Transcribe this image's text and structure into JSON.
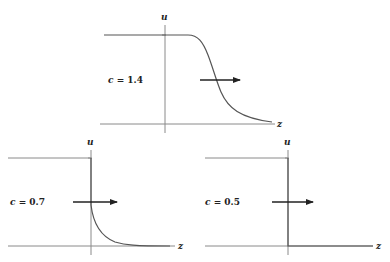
{
  "diagram": {
    "type": "traveling-wave-profiles",
    "panels": [
      {
        "id": "top",
        "c_label": "c = 1.4",
        "c_var": "c",
        "c_value": "= 1.4",
        "y_axis_label": "u",
        "x_axis_label": "z",
        "profile": "smooth sigmoid decreasing from u=1 to u=0 for z>0",
        "arrow_direction": "right"
      },
      {
        "id": "bottom-left",
        "c_label": "c = 0.7",
        "c_var": "c",
        "c_value": "= 0.7",
        "y_axis_label": "u",
        "x_axis_label": "z",
        "profile": "jump at z=0 then exponential-like decay to 0",
        "arrow_direction": "right"
      },
      {
        "id": "bottom-right",
        "c_label": "c = 0.5",
        "c_var": "c",
        "c_value": "= 0.5",
        "y_axis_label": "u",
        "x_axis_label": "z",
        "profile": "step function: u=1 for z<0, u=0 for z>0",
        "arrow_direction": "right"
      }
    ],
    "colors": {
      "axis": "#8a8a8a",
      "curve": "#555555",
      "arrow": "#222222",
      "text": "#222222"
    }
  }
}
